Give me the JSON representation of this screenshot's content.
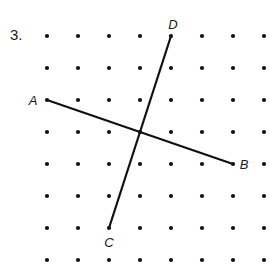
{
  "problem_number": "3.",
  "grid": {
    "columns": 8,
    "rows": 8
  },
  "points": [
    {
      "name": "A",
      "col": 0,
      "row": 2,
      "label_side": "left"
    },
    {
      "name": "B",
      "col": 6,
      "row": 4,
      "label_side": "right"
    },
    {
      "name": "C",
      "col": 2,
      "row": 6,
      "label_side": "below"
    },
    {
      "name": "D",
      "col": 4,
      "row": 0,
      "label_side": "above"
    }
  ],
  "segments": [
    {
      "name": "AB",
      "from": "A",
      "to": "B"
    },
    {
      "name": "CD",
      "from": "C",
      "to": "D"
    }
  ],
  "colors": {
    "ink": "#111111",
    "background": "#ffffff"
  }
}
